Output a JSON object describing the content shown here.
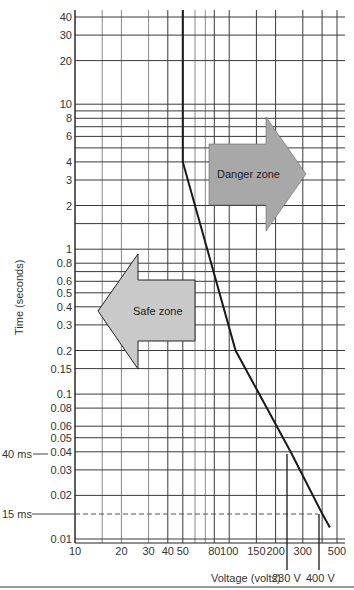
{
  "chart_data": {
    "type": "line",
    "title": "",
    "xlabel": "Voltage (volts)",
    "ylabel": "Time (seconds)",
    "xscale": "log",
    "yscale": "log",
    "xlim": [
      10,
      500
    ],
    "ylim": [
      0.01,
      40
    ],
    "grid": true,
    "x_ticks": [
      {
        "v": 10,
        "label": "10"
      },
      {
        "v": 20,
        "label": "20"
      },
      {
        "v": 30,
        "label": "30"
      },
      {
        "v": 40,
        "label": "40"
      },
      {
        "v": 50,
        "label": "50"
      },
      {
        "v": 80,
        "label": "80"
      },
      {
        "v": 100,
        "label": "100"
      },
      {
        "v": 150,
        "label": "150"
      },
      {
        "v": 200,
        "label": "200"
      },
      {
        "v": 300,
        "label": "300"
      },
      {
        "v": 500,
        "label": "500"
      }
    ],
    "x_grid": [
      10,
      15,
      20,
      30,
      40,
      50,
      60,
      70,
      80,
      100,
      150,
      200,
      300,
      400,
      500
    ],
    "y_ticks": [
      {
        "v": 40,
        "label": "40"
      },
      {
        "v": 30,
        "label": "30"
      },
      {
        "v": 20,
        "label": "20"
      },
      {
        "v": 10,
        "label": "10"
      },
      {
        "v": 8,
        "label": "8"
      },
      {
        "v": 6,
        "label": "6"
      },
      {
        "v": 4,
        "label": "4"
      },
      {
        "v": 3,
        "label": "3"
      },
      {
        "v": 2,
        "label": "2"
      },
      {
        "v": 1,
        "label": "1"
      },
      {
        "v": 0.8,
        "label": "0.8"
      },
      {
        "v": 0.6,
        "label": "0.6"
      },
      {
        "v": 0.5,
        "label": "0.5"
      },
      {
        "v": 0.4,
        "label": "0.4"
      },
      {
        "v": 0.3,
        "label": "0.3"
      },
      {
        "v": 0.2,
        "label": "0.2"
      },
      {
        "v": 0.15,
        "label": "0.15"
      },
      {
        "v": 0.1,
        "label": "0.1"
      },
      {
        "v": 0.08,
        "label": "0.08"
      },
      {
        "v": 0.06,
        "label": "0.06"
      },
      {
        "v": 0.05,
        "label": "0.05"
      },
      {
        "v": 0.04,
        "label": "0.04"
      },
      {
        "v": 0.03,
        "label": "0.03"
      },
      {
        "v": 0.02,
        "label": "0.02"
      },
      {
        "v": 0.01,
        "label": "0.01"
      }
    ],
    "y_grid": [
      40,
      30,
      20,
      10,
      9,
      8,
      7,
      6,
      5,
      4,
      3,
      2,
      1.5,
      1,
      0.8,
      0.7,
      0.6,
      0.5,
      0.4,
      0.3,
      0.2,
      0.15,
      0.1,
      0.08,
      0.06,
      0.05,
      0.04,
      0.03,
      0.02,
      0.01
    ],
    "series": [
      {
        "name": "Safety curve",
        "points": [
          [
            50,
            40
          ],
          [
            50,
            4
          ],
          [
            110,
            0.2
          ],
          [
            250,
            0.04
          ],
          [
            400,
            0.015
          ],
          [
            450,
            0.012
          ]
        ]
      }
    ],
    "annotations": [
      {
        "type": "hline-label",
        "y": 0.04,
        "label": "40 ms"
      },
      {
        "type": "hline-dashed",
        "y": 0.015,
        "label": "15 ms"
      },
      {
        "type": "vline",
        "x": 250,
        "label": "230 V"
      },
      {
        "type": "vline",
        "x": 400,
        "label": "400 V"
      },
      {
        "type": "arrow-right",
        "label": "Danger zone"
      },
      {
        "type": "arrow-left",
        "label": "Safe zone"
      }
    ],
    "colors": {
      "grid": "#3a3a3a",
      "grid_light": "#8a8a8a",
      "curve": "#1a1a1a",
      "arrow_fill": "#a8a8a8",
      "arrow_fill_safe": "#c9c9c9"
    }
  },
  "labels": {
    "xlabel": "Voltage (volts)",
    "ylabel": "Time (seconds)",
    "ms40": "40 ms",
    "ms15": "15 ms",
    "v230": "230 V",
    "v400": "400 V",
    "danger": "Danger zone",
    "safe": "Safe zone"
  }
}
